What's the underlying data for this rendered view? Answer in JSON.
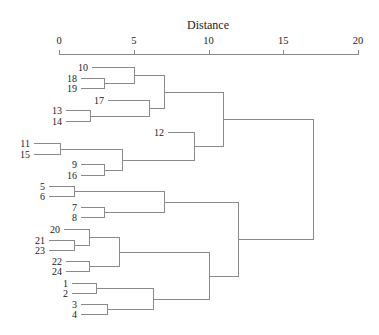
{
  "chart_data": {
    "type": "dendrogram",
    "title": "",
    "xlabel": "Distance",
    "ylabel": "",
    "xlim": [
      0,
      20
    ],
    "ticks": [
      0,
      5,
      10,
      15,
      20
    ],
    "tick_labels": [
      "0",
      "5",
      "10",
      "15",
      "20"
    ],
    "grid": false,
    "leaf_order": [
      "10",
      "18",
      "19",
      "17",
      "13",
      "14",
      "12",
      "11",
      "15",
      "9",
      "16",
      "5",
      "6",
      "7",
      "8",
      "20",
      "21",
      "23",
      "22",
      "24",
      "1",
      "2",
      "3",
      "4"
    ],
    "merges": [
      {
        "id": "A",
        "children": [
          "18",
          "19"
        ],
        "height": 3.0
      },
      {
        "id": "B",
        "children": [
          "10",
          "A"
        ],
        "height": 5.0
      },
      {
        "id": "C",
        "children": [
          "13",
          "14"
        ],
        "height": 2.1
      },
      {
        "id": "D",
        "children": [
          "17",
          "C"
        ],
        "height": 6.0
      },
      {
        "id": "E",
        "children": [
          "B",
          "D"
        ],
        "height": 7.0
      },
      {
        "id": "F",
        "children": [
          "11",
          "15"
        ],
        "height": 0.1
      },
      {
        "id": "G",
        "children": [
          "9",
          "16"
        ],
        "height": 3.0
      },
      {
        "id": "H",
        "children": [
          "F",
          "G"
        ],
        "height": 4.2
      },
      {
        "id": "I",
        "children": [
          "12",
          "H"
        ],
        "height": 9.0
      },
      {
        "id": "J",
        "children": [
          "E",
          "I"
        ],
        "height": 11.0
      },
      {
        "id": "K",
        "children": [
          "5",
          "6"
        ],
        "height": 1.0
      },
      {
        "id": "L",
        "children": [
          "7",
          "8"
        ],
        "height": 3.0
      },
      {
        "id": "M",
        "children": [
          "K",
          "L"
        ],
        "height": 7.0
      },
      {
        "id": "N",
        "children": [
          "21",
          "23"
        ],
        "height": 1.0
      },
      {
        "id": "O",
        "children": [
          "20",
          "N"
        ],
        "height": 2.0
      },
      {
        "id": "P",
        "children": [
          "22",
          "24"
        ],
        "height": 2.0
      },
      {
        "id": "Q",
        "children": [
          "O",
          "P"
        ],
        "height": 4.0
      },
      {
        "id": "R",
        "children": [
          "1",
          "2"
        ],
        "height": 2.5
      },
      {
        "id": "S",
        "children": [
          "3",
          "4"
        ],
        "height": 3.2
      },
      {
        "id": "T",
        "children": [
          "R",
          "S"
        ],
        "height": 6.3
      },
      {
        "id": "U",
        "children": [
          "Q",
          "T"
        ],
        "height": 10.0
      },
      {
        "id": "V",
        "children": [
          "M",
          "U"
        ],
        "height": 12.0
      },
      {
        "id": "W",
        "children": [
          "J",
          "V"
        ],
        "height": 17.0
      }
    ],
    "leaf_y": {
      "10": 67,
      "18": 78,
      "19": 88,
      "17": 100,
      "13": 110,
      "14": 121,
      "12": 132,
      "11": 143,
      "15": 154,
      "9": 164,
      "16": 175,
      "5": 186,
      "6": 196,
      "7": 207,
      "8": 217,
      "20": 229,
      "21": 240,
      "23": 250,
      "22": 261,
      "24": 271,
      "1": 283,
      "2": 293,
      "3": 304,
      "4": 314
    },
    "leaf_line_start_x": {
      "10": 92,
      "18": 81,
      "19": 81,
      "17": 108,
      "13": 66,
      "14": 66,
      "12": 168,
      "11": 34,
      "15": 34,
      "9": 81,
      "16": 81,
      "5": 49,
      "6": 49,
      "7": 81,
      "8": 81,
      "20": 64,
      "21": 49,
      "23": 49,
      "22": 66,
      "24": 66,
      "1": 72,
      "2": 72,
      "3": 81,
      "4": 81
    }
  }
}
